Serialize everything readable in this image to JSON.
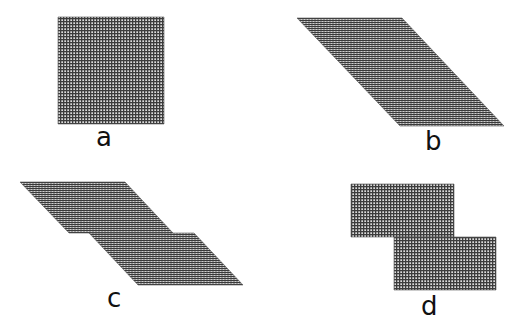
{
  "figure": {
    "colors": {
      "background": "#ffffff",
      "grid_dark": "#3a3a3a",
      "grid_light": "#d8d8d8",
      "label": "#111111"
    },
    "panels": [
      {
        "id": "a",
        "label": "a",
        "shape": "square",
        "polygons": [
          "58,17 164,17 164,124 58,124"
        ],
        "texture": "grid",
        "label_pos": {
          "x": 96,
          "y": 124
        }
      },
      {
        "id": "b",
        "label": "b",
        "shape": "sheared parallelogram",
        "polygons": [
          "297,18 402,18 504,126 400,126"
        ],
        "texture": "horizontal-lines",
        "label_pos": {
          "x": 425,
          "y": 128
        }
      },
      {
        "id": "c",
        "label": "c",
        "shape": "two offset parallelograms",
        "polygons": [
          "20,182 125,182 173,233 69,233",
          "89,233 194,233 243,285 138,285"
        ],
        "texture": "horizontal-lines",
        "label_pos": {
          "x": 107,
          "y": 285
        }
      },
      {
        "id": "d",
        "label": "d",
        "shape": "two offset rectangles",
        "polygons": [
          "351,184 454,184 454,237 351,237",
          "394,237 496,237 496,290 394,290"
        ],
        "texture": "grid",
        "label_pos": {
          "x": 421,
          "y": 293
        }
      }
    ]
  }
}
